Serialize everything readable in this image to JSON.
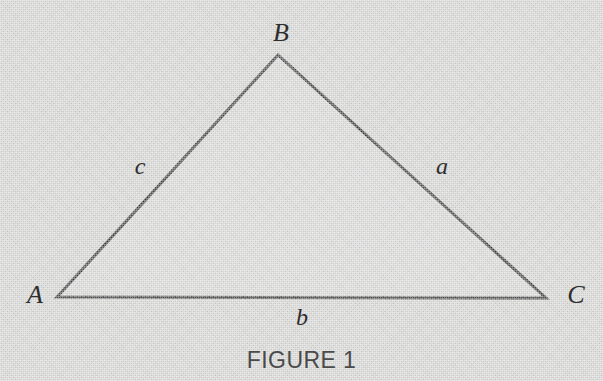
{
  "figure": {
    "caption": "FIGURE 1",
    "width": 603,
    "height": 381,
    "background_color": "#d5d5d4",
    "stroke_color": "#3a3a3a",
    "fill_color": "#d9d9d8",
    "text_color": "#2e2e2e",
    "caption_color": "#4a4a4a",
    "stroke_width": 3
  },
  "diagram": {
    "type": "triangle",
    "vertices": [
      {
        "label": "A",
        "x": 57,
        "y": 297,
        "label_x": 35,
        "label_y": 295
      },
      {
        "label": "B",
        "x": 278,
        "y": 55,
        "label_x": 281,
        "label_y": 33
      },
      {
        "label": "C",
        "x": 546,
        "y": 298,
        "label_x": 576,
        "label_y": 295
      }
    ],
    "sides": [
      {
        "label": "a",
        "from": "B",
        "to": "C",
        "label_x": 442,
        "label_y": 166
      },
      {
        "label": "b",
        "from": "A",
        "to": "C",
        "label_x": 302,
        "label_y": 317
      },
      {
        "label": "c",
        "from": "A",
        "to": "B",
        "label_x": 140,
        "label_y": 166
      }
    ],
    "caption_x": 302,
    "caption_y": 358
  }
}
